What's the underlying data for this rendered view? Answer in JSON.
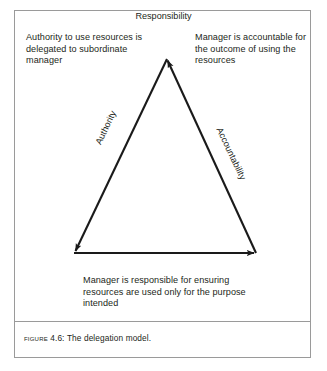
{
  "figure": {
    "caption_label": "Figure",
    "caption_number": "4.6:",
    "caption_title": "The delegation model.",
    "border_color": "#9a9a9a",
    "text_color": "#231f20",
    "background": "#ffffff"
  },
  "diagram": {
    "type": "triangle-cycle",
    "notes": {
      "top_left": "Authority to use resources is delegated to subordinate manager",
      "top_right": "Manager is accountable for the outcome of using the resources",
      "bottom": "Manager is responsible for ensuring resources are used only for the purpose intended"
    },
    "edges": [
      {
        "label": "Authority",
        "from": "apex",
        "to": "bottom-left",
        "direction": "down-left",
        "arrowhead": true
      },
      {
        "label": "Responsibility",
        "from": "bottom-left",
        "to": "bottom-right",
        "direction": "right",
        "arrowhead": true
      },
      {
        "label": "Accountability",
        "from": "bottom-right",
        "to": "apex",
        "direction": "up-left",
        "arrowhead": true
      }
    ],
    "vertices": {
      "apex": {
        "x": 152,
        "y": 47
      },
      "bottom_left": {
        "x": 59,
        "y": 242
      },
      "bottom_right": {
        "x": 241,
        "y": 242
      }
    },
    "stroke_color": "#1a1a1a"
  }
}
